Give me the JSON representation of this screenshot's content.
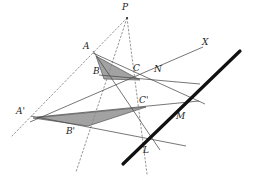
{
  "figure": {
    "canvas": {
      "width": 253,
      "height": 180,
      "background": "#ffffff"
    },
    "colors": {
      "stroke_solid": "#4a4a4a",
      "stroke_dotted": "#8a8a8a",
      "stroke_axis": "#111111",
      "triangle_fill": "#9a9a9a",
      "triangle_edge": "#555555",
      "label_color": "#1c1c1c"
    },
    "labels": [
      {
        "name": "label-P",
        "text": "P",
        "x": 122,
        "y": 3
      },
      {
        "name": "label-A",
        "text": "A",
        "x": 83,
        "y": 42
      },
      {
        "name": "label-B",
        "text": "B",
        "x": 93,
        "y": 67
      },
      {
        "name": "label-C",
        "text": "C",
        "x": 133,
        "y": 64
      },
      {
        "name": "label-N",
        "text": "N",
        "x": 154,
        "y": 65
      },
      {
        "name": "label-X",
        "text": "X",
        "x": 202,
        "y": 38
      },
      {
        "name": "label-Cp",
        "text": "C'",
        "x": 139,
        "y": 96
      },
      {
        "name": "label-M",
        "text": "M",
        "x": 176,
        "y": 112
      },
      {
        "name": "label-Ap",
        "text": "A'",
        "x": 16,
        "y": 107
      },
      {
        "name": "label-Bp",
        "text": "B'",
        "x": 66,
        "y": 127
      },
      {
        "name": "label-L",
        "text": "L",
        "x": 143,
        "y": 146
      }
    ],
    "points": {
      "P": {
        "x": 127,
        "y": 18
      },
      "A": {
        "x": 96,
        "y": 56
      },
      "B": {
        "x": 104,
        "y": 79
      },
      "C": {
        "x": 140,
        "y": 80
      },
      "Ap": {
        "x": 33,
        "y": 118
      },
      "Bp": {
        "x": 88,
        "y": 126
      },
      "Cp": {
        "x": 146,
        "y": 107
      },
      "L": {
        "x": 146,
        "y": 140
      },
      "M": {
        "x": 178,
        "y": 107
      },
      "N": {
        "x": 163,
        "y": 78
      },
      "X": {
        "x": 198,
        "y": 46
      }
    },
    "triangles": [
      {
        "name": "triangle-ABC",
        "vertices": "96,56 104,79 140,80"
      },
      {
        "name": "triangle-ApBpCp",
        "vertices": "33,118 88,126 146,107"
      }
    ],
    "projector_lines": [
      {
        "name": "projector-P-A-Ap",
        "from": "127,18",
        "to": "12,136"
      },
      {
        "name": "projector-P-B-Bp",
        "from": "127,18",
        "to": "76,172"
      },
      {
        "name": "projector-P-C-Cp",
        "from": "127,18",
        "to": "147,174"
      }
    ],
    "side_lines": [
      {
        "name": "line-BC-to-N",
        "from": "99,75",
        "to": "200,84"
      },
      {
        "name": "line-AC-to-M",
        "from": "93,53",
        "to": "205,104"
      },
      {
        "name": "line-AB-to-L",
        "from": "93,51",
        "to": "160,150"
      },
      {
        "name": "line-BpCp-to-M",
        "from": "37,117",
        "to": "199,101"
      },
      {
        "name": "line-ApCp-to-N",
        "from": "30,122",
        "to": "203,47"
      },
      {
        "name": "line-ApBp-to-L",
        "from": "31,116",
        "to": "186,146"
      }
    ],
    "axis_line": {
      "name": "perspectivity-axis",
      "from": "123,164",
      "to": "240,51",
      "width": 3.2
    }
  }
}
